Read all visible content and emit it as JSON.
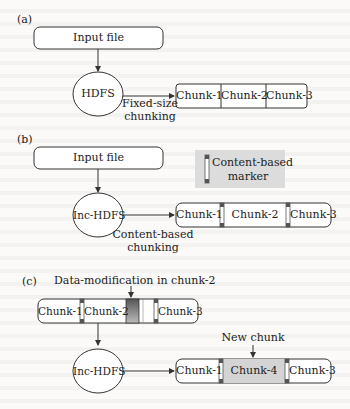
{
  "panel_a": {
    "label": "(a)",
    "input_box": "Input file",
    "processor": "HDFS",
    "edge_label_line1": "Fixed-size",
    "edge_label_line2": "chunking",
    "chunks": [
      "Chunk-1",
      "Chunk-2",
      "Chunk-3"
    ]
  },
  "panel_b": {
    "label": "(b)",
    "input_box": "Input file",
    "processor": "Inc-HDFS",
    "edge_label_line1": "Content-based",
    "edge_label_line2": "chunking",
    "chunks": [
      "Chunk-1",
      "Chunk-2",
      "Chunk-3"
    ],
    "legend_line1": "Content-based",
    "legend_line2": "marker"
  },
  "panel_c": {
    "label": "(c)",
    "annotation_top": "Data-modification in chunk-2",
    "chunks_before": [
      "Chunk-1",
      "Chunk-2",
      "Chunk-3"
    ],
    "processor": "Inc-HDFS",
    "annotation_new": "New chunk",
    "chunks_after": [
      "Chunk-1",
      "Chunk-4",
      "Chunk-3"
    ]
  },
  "colors": {
    "stroke": "#333333",
    "legend_bg": "#dcdcdc",
    "new_chunk_bg": "#d4d4d4",
    "marker_dark": "#555555"
  }
}
